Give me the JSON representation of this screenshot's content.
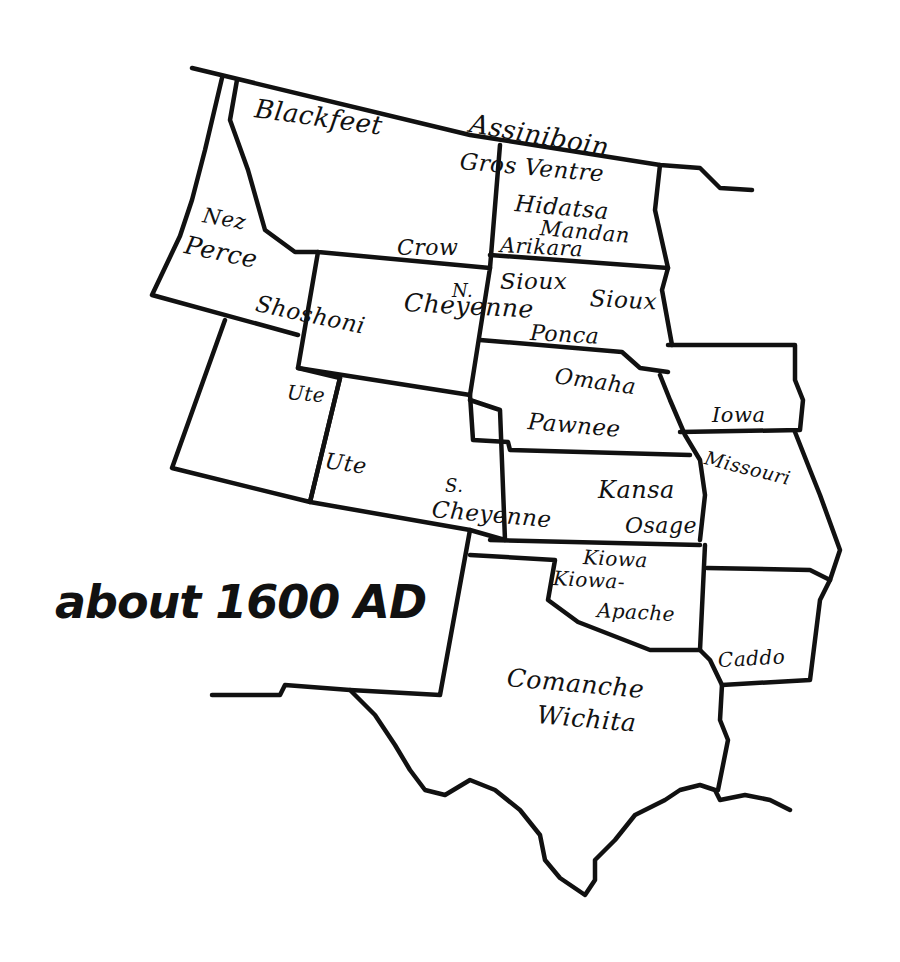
{
  "caption": "about 1600 AD",
  "colors": {
    "ink": "#111111",
    "paper": "#ffffff"
  },
  "tribes": [
    {
      "name": "Blackfeet",
      "x": 255,
      "y": 95,
      "size": 26,
      "rot": 8
    },
    {
      "name": "Assiniboin",
      "x": 470,
      "y": 110,
      "size": 26,
      "rot": 10
    },
    {
      "name": "Gros Ventre",
      "x": 460,
      "y": 150,
      "size": 23,
      "rot": 5
    },
    {
      "name": "Hidatsa",
      "x": 515,
      "y": 192,
      "size": 23,
      "rot": 5
    },
    {
      "name": "Mandan",
      "x": 540,
      "y": 218,
      "size": 21,
      "rot": 5
    },
    {
      "name": "Arikara",
      "x": 500,
      "y": 235,
      "size": 21,
      "rot": 3
    },
    {
      "name": "Nez",
      "x": 203,
      "y": 205,
      "size": 21,
      "rot": 10
    },
    {
      "name": "Perce",
      "x": 185,
      "y": 232,
      "size": 25,
      "rot": 12
    },
    {
      "name": "Crow",
      "x": 397,
      "y": 237,
      "size": 22,
      "rot": 0
    },
    {
      "name": "Sioux",
      "x": 500,
      "y": 270,
      "size": 23,
      "rot": 0
    },
    {
      "name": "Sioux",
      "x": 590,
      "y": 287,
      "size": 23,
      "rot": 3
    },
    {
      "name": "N.",
      "x": 452,
      "y": 282,
      "size": 18,
      "rot": 0
    },
    {
      "name": "Cheyenne",
      "x": 404,
      "y": 290,
      "size": 25,
      "rot": 3
    },
    {
      "name": "Shoshoni",
      "x": 256,
      "y": 292,
      "size": 23,
      "rot": 12
    },
    {
      "name": "Ponca",
      "x": 530,
      "y": 322,
      "size": 22,
      "rot": 3
    },
    {
      "name": "Omaha",
      "x": 555,
      "y": 365,
      "size": 22,
      "rot": 8
    },
    {
      "name": "Ute",
      "x": 287,
      "y": 382,
      "size": 20,
      "rot": 5
    },
    {
      "name": "Iowa",
      "x": 712,
      "y": 405,
      "size": 21,
      "rot": 0
    },
    {
      "name": "Pawnee",
      "x": 528,
      "y": 410,
      "size": 23,
      "rot": 5
    },
    {
      "name": "Missouri",
      "x": 705,
      "y": 448,
      "size": 19,
      "rot": 14
    },
    {
      "name": "Ute",
      "x": 325,
      "y": 450,
      "size": 22,
      "rot": 8
    },
    {
      "name": "Kansa",
      "x": 598,
      "y": 478,
      "size": 24,
      "rot": 0
    },
    {
      "name": "S.",
      "x": 445,
      "y": 477,
      "size": 18,
      "rot": 0
    },
    {
      "name": "Cheyenne",
      "x": 432,
      "y": 498,
      "size": 23,
      "rot": 5
    },
    {
      "name": "Osage",
      "x": 625,
      "y": 515,
      "size": 22,
      "rot": 0
    },
    {
      "name": "Kiowa",
      "x": 583,
      "y": 547,
      "size": 20,
      "rot": 3
    },
    {
      "name": "Kiowa-",
      "x": 553,
      "y": 568,
      "size": 20,
      "rot": 3
    },
    {
      "name": "Apache",
      "x": 597,
      "y": 600,
      "size": 20,
      "rot": 3
    },
    {
      "name": "Caddo",
      "x": 718,
      "y": 650,
      "size": 20,
      "rot": -3
    },
    {
      "name": "Comanche",
      "x": 507,
      "y": 665,
      "size": 25,
      "rot": 5
    },
    {
      "name": "Wichita",
      "x": 537,
      "y": 702,
      "size": 25,
      "rot": 5
    }
  ]
}
